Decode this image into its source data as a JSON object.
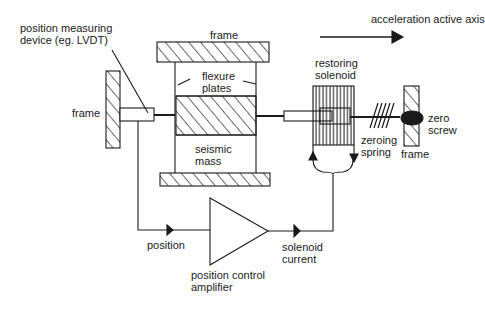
{
  "diagram": {
    "labels": {
      "axis": "acceleration active axis",
      "lvdt_1": "position measuring",
      "lvdt_2": "device (eg. LVDT)",
      "frame_top": "frame",
      "frame_left": "frame",
      "frame_right": "frame",
      "flexure_1": "flexure",
      "flexure_2": "plates",
      "mass_1": "seismic",
      "mass_2": "mass",
      "solenoid_1": "restoring",
      "solenoid_2": "solenoid",
      "spring_1": "zeroing",
      "spring_2": "spring",
      "screw_1": "zero",
      "screw_2": "screw",
      "position": "position",
      "current_1": "solenoid",
      "current_2": "current",
      "amp_1": "position control",
      "amp_2": "amplifier"
    },
    "colors": {
      "line": "#1a1a1a",
      "background": "#ffffff"
    }
  }
}
